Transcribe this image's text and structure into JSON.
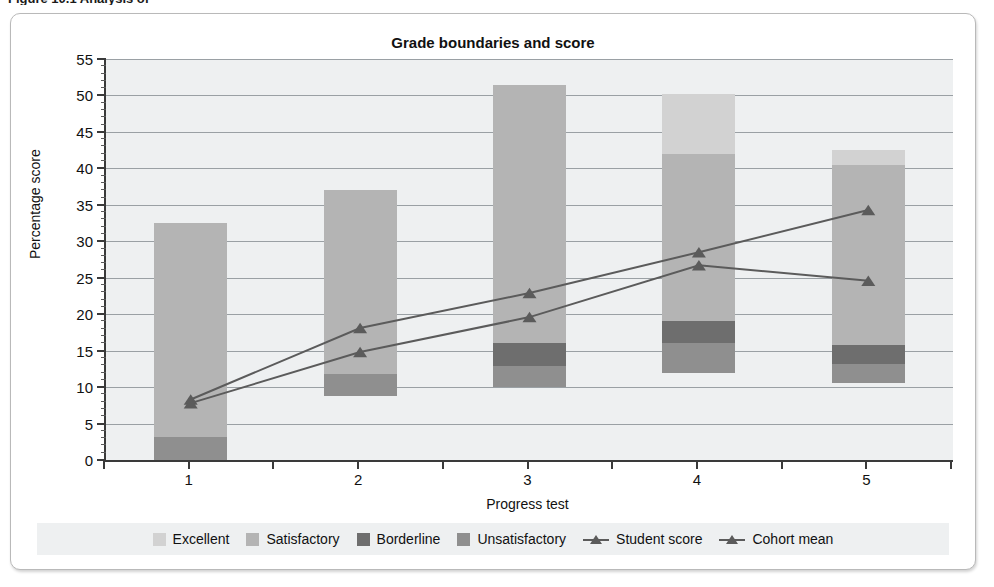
{
  "caption": "Figure 10.1  Analysis of",
  "chart_data": {
    "type": "bar",
    "title": "Grade boundaries and score",
    "xlabel": "Progress test",
    "ylabel": "Percentage score",
    "categories": [
      "1",
      "2",
      "3",
      "4",
      "5"
    ],
    "ylim": [
      0,
      55
    ],
    "ytick_step": 5,
    "yticks": [
      0,
      5,
      10,
      15,
      20,
      25,
      30,
      35,
      40,
      45,
      50,
      55
    ],
    "minor_tick_step": 1,
    "grid": true,
    "legend_position": "bottom",
    "stacked": true,
    "band_series": [
      {
        "name": "Unsatisfactory",
        "color": "#8f8f8f",
        "from": [
          0.0,
          8.8,
          10.0,
          11.9,
          10.6
        ],
        "to": [
          3.1,
          11.8,
          12.9,
          16.0,
          13.1
        ]
      },
      {
        "name": "Borderline",
        "color": "#6e6e6e",
        "from": [
          3.1,
          11.8,
          12.9,
          16.0,
          13.1
        ],
        "to": [
          3.1,
          11.8,
          16.0,
          19.0,
          15.8
        ]
      },
      {
        "name": "Satisfactory",
        "color": "#b4b4b4",
        "from": [
          3.1,
          11.8,
          16.0,
          19.0,
          15.8
        ],
        "to": [
          32.5,
          37.0,
          51.5,
          42.0,
          40.5
        ]
      },
      {
        "name": "Excellent",
        "color": "#d2d2d2",
        "from": [
          32.5,
          37.0,
          51.5,
          42.0,
          40.5
        ],
        "to": [
          32.5,
          37.0,
          51.5,
          50.2,
          42.5
        ]
      }
    ],
    "line_series": [
      {
        "name": "Student score",
        "color": "#5b5b5b",
        "marker": "triangle",
        "values": [
          8.3,
          18.1,
          22.9,
          28.5,
          34.3
        ]
      },
      {
        "name": "Cohort mean",
        "color": "#5b5b5b",
        "marker": "triangle",
        "values": [
          7.8,
          14.8,
          19.6,
          26.7,
          24.6
        ]
      }
    ],
    "legend": [
      {
        "label": "Excellent",
        "type": "swatch",
        "color": "#d2d2d2"
      },
      {
        "label": "Satisfactory",
        "type": "swatch",
        "color": "#b4b4b4"
      },
      {
        "label": "Borderline",
        "type": "swatch",
        "color": "#6e6e6e"
      },
      {
        "label": "Unsatisfactory",
        "type": "swatch",
        "color": "#8f8f8f"
      },
      {
        "label": "Student score",
        "type": "line",
        "color": "#5b5b5b"
      },
      {
        "label": "Cohort mean",
        "type": "line",
        "color": "#5b5b5b"
      }
    ]
  }
}
